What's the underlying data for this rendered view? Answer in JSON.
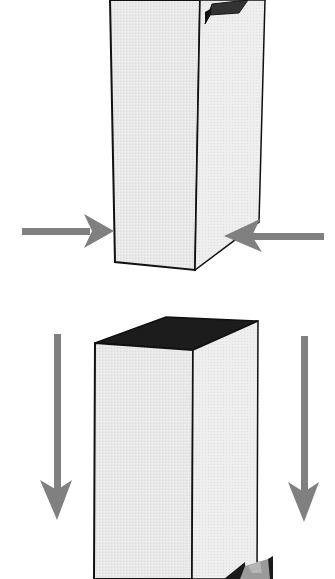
{
  "figure": {
    "colors": {
      "background": "#ffffff",
      "face_light": "#e6e6e6",
      "face_side": "#ececec",
      "top_face_dark": "#1c1c1c",
      "tab_dark": "#3a3a3a",
      "outline": "#111111",
      "arrow": "#808080"
    },
    "panels": [
      {
        "id": "top",
        "label": "",
        "arrows": [
          {
            "direction": "right",
            "position": "left-side"
          },
          {
            "direction": "left",
            "position": "right-side"
          }
        ]
      },
      {
        "id": "bottom",
        "label": "",
        "arrows": [
          {
            "direction": "down",
            "position": "left-side"
          },
          {
            "direction": "down",
            "position": "right-side"
          },
          {
            "direction": "left",
            "position": "bottom-right-partial"
          }
        ]
      }
    ]
  }
}
